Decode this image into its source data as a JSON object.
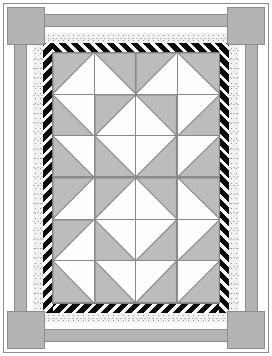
{
  "figure": {
    "name": "pieced-quilt-diagram",
    "type": "quilt-block-layout-diagram",
    "orientation": "portrait",
    "width_px": 272,
    "height_px": 356
  },
  "palette": {
    "background": "#ffffff",
    "page_frame_line": "#8d8d8d",
    "medium_grey": "#b4b4b4",
    "patch_grey": "#bcbcbc",
    "patch_white": "#fdfdfd",
    "seam_line": "#8a8a8a",
    "stripe_dark": "#0b0b0b",
    "stripe_light": "#fbfbfb",
    "speckle_base": "#f2f2f0"
  },
  "page_frame": {
    "label": "outer page rule",
    "x": 3,
    "y": 3,
    "w": 266,
    "h": 350,
    "stroke": "#8d8d8d"
  },
  "corner_squares": {
    "label": "corner stone squares",
    "count": 4,
    "size": 38,
    "fill": "#b4b4b4",
    "stroke": "#8d8d8d",
    "positions": [
      {
        "name": "corner-top-left",
        "x": 7,
        "y": 7
      },
      {
        "name": "corner-top-right",
        "x": 227,
        "y": 7
      },
      {
        "name": "corner-bottom-left",
        "x": 7,
        "y": 311
      },
      {
        "name": "corner-bottom-right",
        "x": 227,
        "y": 311
      }
    ]
  },
  "borders": {
    "label": "concentric border bands, outer to inner",
    "bands": [
      {
        "order": 1,
        "name": "band-white-outer",
        "fabric": "plain white",
        "fill": "#ffffff",
        "thickness_px": 5
      },
      {
        "order": 2,
        "name": "band-grey-wide",
        "fabric": "solid medium grey",
        "fill": "#b4b4b4",
        "thickness_px": 12
      },
      {
        "order": 3,
        "name": "band-white-inner",
        "fabric": "plain white",
        "fill": "#ffffff",
        "thickness_px": 6
      },
      {
        "order": 4,
        "name": "band-speckled",
        "fabric": "speckled muslin print",
        "fill": "#f2f2f0",
        "thickness_px": 9
      },
      {
        "order": 5,
        "name": "band-diagonal-stripe",
        "fabric": "black & white diagonal stripe",
        "fill": "#0b0b0b",
        "thickness_px": 9
      }
    ]
  },
  "inner_field": {
    "label": "pieced centre field",
    "x": 53,
    "y": 53,
    "w": 166,
    "h": 250,
    "grid_cols": 4,
    "grid_rows": 6,
    "unit_block": "half-square triangle (HST)",
    "grey": "#bcbcbc",
    "white": "#fdfdfd",
    "motif": "concentric nested diamonds / barn-raising",
    "blocks": [
      [
        "hst-tl-grey",
        "hst-tr-grey",
        "hst-tl-grey",
        "hst-tr-grey"
      ],
      [
        "hst-bl-grey",
        "hst-tl-grey",
        "hst-tr-grey",
        "hst-br-grey"
      ],
      [
        "hst-bl-grey",
        "hst-bl-grey",
        "hst-br-grey",
        "hst-br-grey"
      ],
      [
        "hst-tl-grey",
        "hst-tl-grey",
        "hst-tr-grey",
        "hst-tr-grey"
      ],
      [
        "hst-tl-grey",
        "hst-bl-grey",
        "hst-br-grey",
        "hst-br-grey"
      ],
      [
        "hst-bl-grey",
        "hst-bl-grey",
        "hst-br-grey",
        "hst-br-grey"
      ]
    ],
    "block_legend": {
      "hst-tl-grey": "grey triangle in top-left half, white bottom-right",
      "hst-tr-grey": "grey triangle in top-right half, white bottom-left",
      "hst-bl-grey": "grey triangle in bottom-left half, white top-right",
      "hst-br-grey": "grey triangle in bottom-right half, white top-left"
    }
  }
}
